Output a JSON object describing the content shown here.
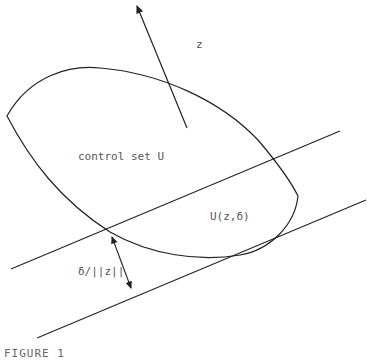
{
  "figure": {
    "caption": "FIGURE 1",
    "labels": {
      "vector": "z",
      "set": "control set  U",
      "subset": "U(z,δ)",
      "distance": "δ/||z||"
    },
    "elements": [
      {
        "name": "control-set-boundary",
        "type": "closed-curve"
      },
      {
        "name": "normal-vector-z",
        "type": "arrow"
      },
      {
        "name": "upper-hyperplane",
        "type": "line"
      },
      {
        "name": "supporting-hyperplane",
        "type": "line"
      },
      {
        "name": "distance-marker",
        "type": "double-arrow"
      }
    ],
    "colors": {
      "stroke": "#222222",
      "text": "#555555"
    }
  }
}
